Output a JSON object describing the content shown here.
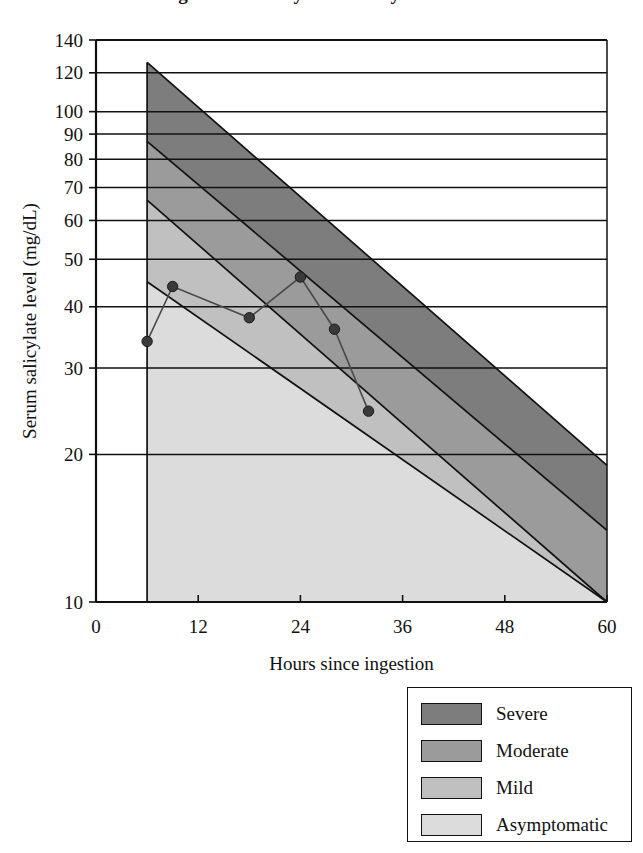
{
  "title": "Done nomogram for salicylate toxicity",
  "chart_data": {
    "type": "line",
    "title": "Done nomogram for salicylate toxicity",
    "xlabel": "Hours since ingestion",
    "ylabel": "Serum salicylate level (mg/dL)",
    "xlim": [
      0,
      60
    ],
    "ylim": [
      10,
      140
    ],
    "yscale": "log",
    "grid": true,
    "legend_position": "below-right",
    "xticks": [
      0,
      12,
      24,
      36,
      48,
      60
    ],
    "xtick_labels": [
      "0",
      "12",
      "24",
      "36",
      "48",
      "60"
    ],
    "yticks": [
      10,
      20,
      30,
      40,
      50,
      60,
      70,
      80,
      90,
      100,
      120,
      140
    ],
    "ytick_labels": [
      "10",
      "20",
      "30",
      "40",
      "50",
      "60",
      "70",
      "80",
      "90",
      "100",
      "120",
      "140"
    ],
    "series": [
      {
        "name": "Patient serum salicylate level",
        "marker": "filled-circle",
        "color": "#3a3a3a",
        "x": [
          6,
          9,
          18,
          24,
          28,
          32
        ],
        "y": [
          34,
          44,
          38,
          46,
          36,
          24.5
        ],
        "points": [
          {
            "x": 6,
            "y": 34
          },
          {
            "x": 9,
            "y": 44
          },
          {
            "x": 18,
            "y": 38
          },
          {
            "x": 24,
            "y": 46
          },
          {
            "x": 28,
            "y": 36
          },
          {
            "x": 32,
            "y": 24.5
          }
        ]
      }
    ],
    "bands": [
      {
        "name": "Severe",
        "color": "#7d7d7d",
        "x_start": 6,
        "x_end": 60,
        "upper_start": 126,
        "upper_end": 19,
        "lower_start": 87,
        "lower_end": 14
      },
      {
        "name": "Moderate",
        "color": "#9b9b9b",
        "x_start": 6,
        "x_end": 60,
        "upper_start": 87,
        "upper_end": 14,
        "lower_start": 66,
        "lower_end": 10
      },
      {
        "name": "Mild",
        "color": "#c0c0c0",
        "x_start": 6,
        "x_end": 60,
        "upper_start": 66,
        "upper_end": 10,
        "lower_start": 45,
        "lower_end": 10
      },
      {
        "name": "Asymptomatic",
        "color": "#dcdcdc",
        "x_start": 6,
        "x_end": 60,
        "upper_start": 45,
        "upper_end": 10,
        "lower_start": 10,
        "lower_end": 10
      }
    ]
  },
  "axes": {
    "x_title": "Hours since ingestion",
    "y_title": "Serum salicylate level (mg/dL)",
    "x_tick_labels": [
      "0",
      "12",
      "24",
      "36",
      "48",
      "60"
    ],
    "y_tick_labels": [
      "140",
      "120",
      "100",
      "90",
      "80",
      "70",
      "60",
      "50",
      "40",
      "30",
      "20",
      "10"
    ]
  },
  "legend": {
    "items": [
      {
        "label": "Severe",
        "color": "#7d7d7d"
      },
      {
        "label": "Moderate",
        "color": "#9b9b9b"
      },
      {
        "label": "Mild",
        "color": "#c0c0c0"
      },
      {
        "label": "Asymptomatic",
        "color": "#dcdcdc"
      }
    ]
  },
  "colors": {
    "axis": "#111111",
    "severe": "#7d7d7d",
    "moderate": "#9b9b9b",
    "mild": "#c0c0c0",
    "asymptomatic": "#dcdcdc",
    "series_line": "#4a4a4a",
    "background": "#ffffff"
  }
}
